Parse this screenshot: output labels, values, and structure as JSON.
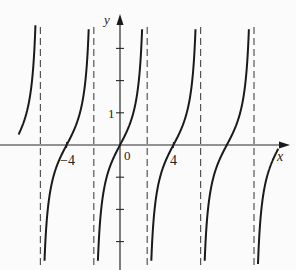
{
  "chart_data": {
    "type": "line",
    "title": "",
    "function": "y = tan(pi*x/4)",
    "xlabel": "x",
    "ylabel": "y",
    "x_tick_labels": [
      {
        "value": -4,
        "label": "−4"
      },
      {
        "value": 0,
        "label": "0"
      },
      {
        "value": 4,
        "label": "4"
      }
    ],
    "y_tick_labels": [
      {
        "value": 1,
        "label": "1"
      }
    ],
    "y_ticks": [
      -3,
      -2,
      -1,
      1,
      2,
      3
    ],
    "asymptotes": [
      -6,
      -2,
      2,
      6,
      10
    ],
    "xlim": [
      -9,
      12.5
    ],
    "ylim": [
      -3.9,
      4.0
    ],
    "grid": false,
    "series": [
      {
        "name": "tan branches",
        "branches": [
          {
            "x_from": -7.6,
            "x_to": -6.12
          },
          {
            "x_from": -5.88,
            "x_to": -2.12
          },
          {
            "x_from": -1.88,
            "x_to": 1.88
          },
          {
            "x_from": 2.12,
            "x_to": 5.88
          },
          {
            "x_from": 6.12,
            "x_to": 9.88
          },
          {
            "x_from": 10.12,
            "x_to": 11.85
          }
        ],
        "x_sample": [
          -4,
          -1,
          0,
          1,
          4
        ],
        "y_sample": [
          0,
          -1,
          0,
          1,
          0
        ]
      }
    ],
    "colors": {
      "curve": "#1a1a1a",
      "axis": "#2a2a2a",
      "asymptote": "#555555",
      "background": "#fbfbfb"
    }
  },
  "labels": {
    "x_axis": "x",
    "y_axis": "y",
    "origin": "0",
    "neg_four": "−4",
    "pos_four": "4",
    "one": "1"
  }
}
